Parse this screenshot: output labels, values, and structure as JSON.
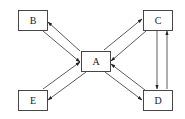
{
  "diagram": {
    "type": "directed-graph",
    "nodes": [
      {
        "id": "A",
        "label": "A",
        "x": 81,
        "y": 51,
        "w": 29,
        "h": 20
      },
      {
        "id": "B",
        "label": "B",
        "x": 18,
        "y": 10,
        "w": 29,
        "h": 20
      },
      {
        "id": "C",
        "label": "C",
        "x": 143,
        "y": 10,
        "w": 29,
        "h": 20
      },
      {
        "id": "D",
        "label": "D",
        "x": 143,
        "y": 90,
        "w": 29,
        "h": 21
      },
      {
        "id": "E",
        "label": "E",
        "x": 18,
        "y": 90,
        "w": 29,
        "h": 21
      }
    ],
    "edges": [
      {
        "from": "A",
        "to": "B"
      },
      {
        "from": "B",
        "to": "A"
      },
      {
        "from": "A",
        "to": "C"
      },
      {
        "from": "C",
        "to": "A"
      },
      {
        "from": "C",
        "to": "D"
      },
      {
        "from": "D",
        "to": "C"
      },
      {
        "from": "A",
        "to": "D"
      },
      {
        "from": "D",
        "to": "A"
      },
      {
        "from": "A",
        "to": "E"
      },
      {
        "from": "E",
        "to": "A"
      }
    ],
    "colors": {
      "stroke": "#333333",
      "fill": "#ffffff",
      "text": "#222222"
    }
  }
}
